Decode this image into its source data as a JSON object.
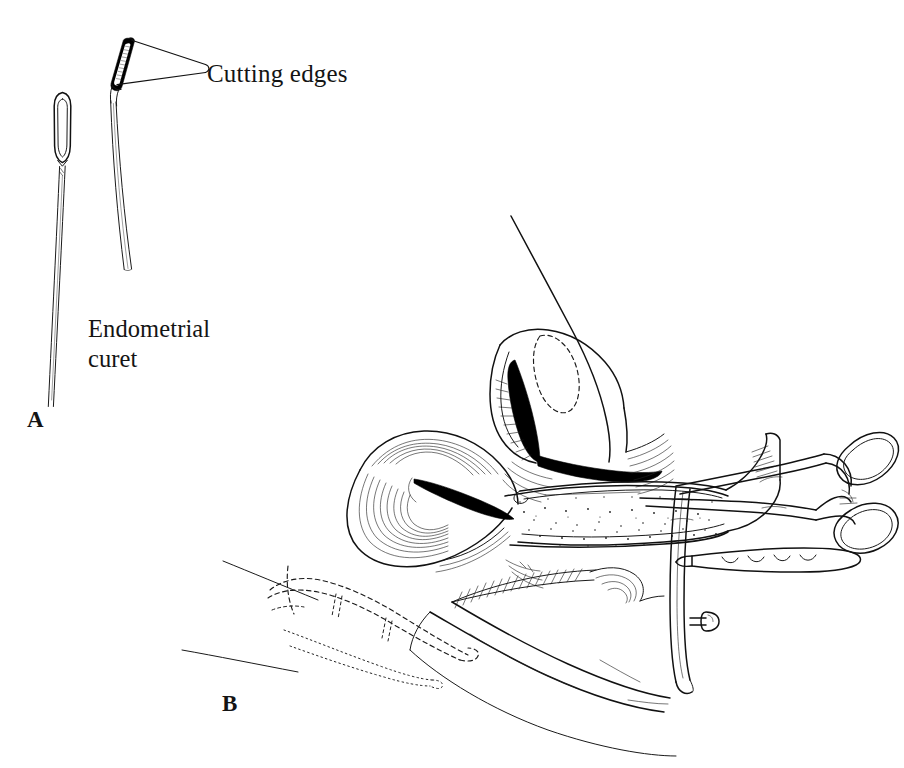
{
  "figure": {
    "kind": "line-art medical illustration",
    "background_color": "#ffffff",
    "ink_color": "#111111",
    "width": 904,
    "height": 768
  },
  "panels": [
    {
      "id": "a",
      "label": "A",
      "label_x": 27,
      "label_y": 406,
      "caption": "Endometrial curet",
      "contents": "Two endometrial curets shown side by side: a straight open-loop curet and an angled curet whose serrated tip is annotated."
    },
    {
      "id": "b",
      "label": "B",
      "label_x": 222,
      "label_y": 690,
      "caption": "",
      "contents": "Sagittal section of the female pelvis with a bivalve speculum in the vagina, a tenaculum forceps grasping the cervix, and the examining hand drawn in dashed outline."
    }
  ],
  "annotations": [
    {
      "id": "cutting-edges",
      "text": "Cutting edges",
      "x": 207,
      "y": 59,
      "font_size": 25,
      "leader_lines": 2,
      "points_to": "the two serrated cutting edges on the angled curet loop"
    },
    {
      "id": "endometrial-curet",
      "text": "Endometrial\ncuret",
      "line_1": "Endometrial",
      "line_2": "curet",
      "x": 88,
      "y": 314,
      "font_size": 24.5,
      "points_to": "the pair of curets in panel A"
    }
  ],
  "instruments": [
    {
      "name": "straight endometrial curet",
      "panel": "a",
      "features": [
        "elongated open oval loop head",
        "long slender shaft",
        "slight shaft taper"
      ]
    },
    {
      "name": "angled endometrial curet",
      "panel": "a",
      "features": [
        "angled serrated loop tip",
        "two cutting edges",
        "long slender double-line shaft"
      ]
    },
    {
      "name": "bivalve vaginal speculum",
      "panel": "b",
      "features": [
        "upper blade",
        "lower blade",
        "handle",
        "thumbscrew knob"
      ]
    },
    {
      "name": "tenaculum forceps",
      "panel": "b",
      "features": [
        "two oval ring handles",
        "box lock ratchet",
        "long shanks grasping the cervix"
      ]
    },
    {
      "name": "uterine sound / dressing forceps",
      "panel": "b",
      "features": [
        "scalloped serrated jaw",
        "straight shank"
      ]
    }
  ],
  "anatomy": [
    {
      "name": "uterine body",
      "rendering": "outlined with dashed oval marking the endometrial cavity"
    },
    {
      "name": "cervix",
      "rendering": "solid black cervical canal with radiating hatch"
    },
    {
      "name": "bladder",
      "rendering": "concentric contour hatching"
    },
    {
      "name": "vaginal canal",
      "rendering": "stippled / textured band"
    },
    {
      "name": "rectum",
      "rendering": "parallel line hatching"
    },
    {
      "name": "perineum and buttock",
      "rendering": "smooth outline contours"
    },
    {
      "name": "examining hand and fingers",
      "rendering": "dashed and dotted outline beneath the perineum"
    }
  ]
}
